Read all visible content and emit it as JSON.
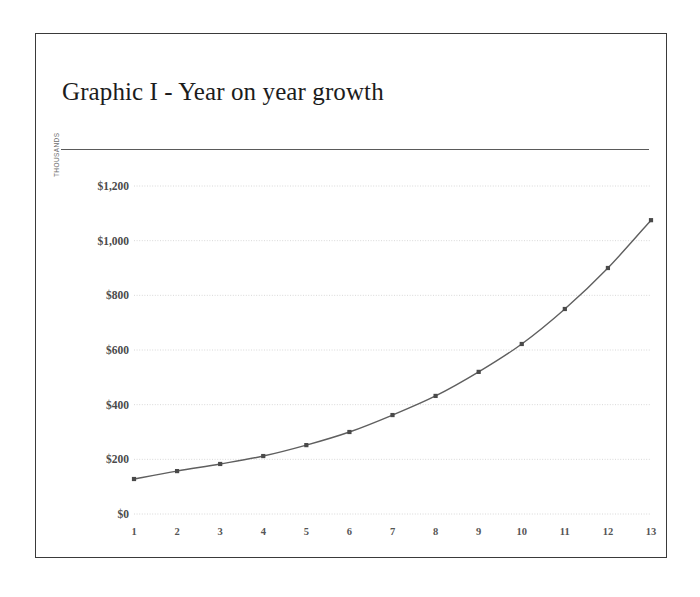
{
  "slide": {
    "title": "Graphic I - Year on year growth"
  },
  "chart_data": {
    "type": "line",
    "title": "Graphic I - Year on year growth",
    "xlabel": "",
    "ylabel": "THOUSANDS",
    "x": [
      1,
      2,
      3,
      4,
      5,
      6,
      7,
      8,
      9,
      10,
      11,
      12,
      13
    ],
    "categories": [
      "1",
      "2",
      "3",
      "4",
      "5",
      "6",
      "7",
      "8",
      "9",
      "10",
      "11",
      "12",
      "13"
    ],
    "values": [
      128,
      157,
      183,
      212,
      252,
      300,
      362,
      432,
      520,
      622,
      750,
      900,
      1075
    ],
    "series": [
      {
        "name": "Year on year growth",
        "values": [
          128,
          157,
          183,
          212,
          252,
          300,
          362,
          432,
          520,
          622,
          750,
          900,
          1075
        ]
      }
    ],
    "ylim": [
      0,
      1200
    ],
    "xlim": [
      1,
      13
    ],
    "ytick_values": [
      0,
      200,
      400,
      600,
      800,
      1000,
      1200
    ],
    "ytick_labels": [
      "$0",
      "$200",
      "$400",
      "$600",
      "$800",
      "$1,000",
      "$1,200"
    ],
    "xtick_labels": [
      "1",
      "2",
      "3",
      "4",
      "5",
      "6",
      "7",
      "8",
      "9",
      "10",
      "11",
      "12",
      "13"
    ],
    "grid": true,
    "grid_style": "dotted-horizontal",
    "legend": false,
    "legend_position": "none",
    "markers": "square",
    "colors": {
      "line": "#5f5f5f",
      "marker": "#4a4a4a",
      "gridline": "#d8d8d8",
      "axis_text": "#4a4a4a",
      "frame": "#3a3a3a",
      "rule": "#5a5a5a",
      "background": "#ffffff"
    }
  }
}
